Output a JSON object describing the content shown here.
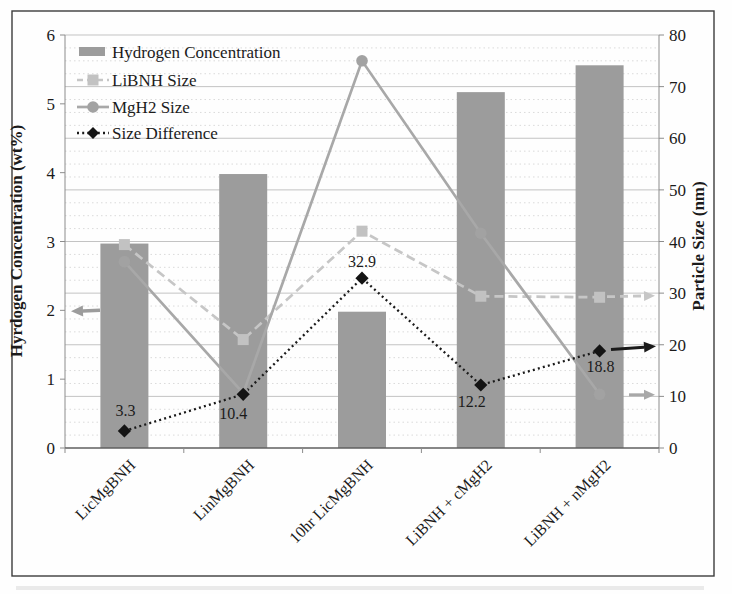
{
  "chart_data": {
    "type": "bar+line combo",
    "categories": [
      "LicMgBNH",
      "LinMgBNH",
      "10hr LicMgBNH",
      "LiBNH + cMgH2",
      "LiBNH + nMgH2"
    ],
    "series": [
      {
        "name": "Hydrogen Concentration",
        "type": "bar",
        "axis": "left",
        "values": [
          2.97,
          3.98,
          1.98,
          5.17,
          5.56
        ],
        "color": "#9c9c9c"
      },
      {
        "name": "LiBNH Size",
        "type": "line",
        "line_style": "dashed",
        "marker": "square",
        "axis": "right",
        "values": [
          39.4,
          21.0,
          42.0,
          29.4,
          29.2
        ],
        "color": "#c6c6c6",
        "marker_color": "#c2c2c2"
      },
      {
        "name": "MgH2 Size",
        "type": "line",
        "line_style": "solid",
        "marker": "circle",
        "axis": "right",
        "values": [
          36.1,
          10.6,
          75.0,
          41.6,
          10.4
        ],
        "color": "#a8a8a8",
        "marker_color": "#a2a2a2"
      },
      {
        "name": "Size Difference",
        "type": "line",
        "line_style": "dotted",
        "marker": "diamond",
        "axis": "right",
        "values": [
          3.3,
          10.4,
          32.9,
          12.2,
          18.8
        ],
        "color": "#1a1a1a",
        "marker_color": "#141414",
        "data_labels": [
          "3.3",
          "10.4",
          "32.9",
          "12.2",
          "18.8"
        ]
      }
    ],
    "left_axis": {
      "title": "Hyrdogen Concentration (wt%)",
      "min": 0,
      "max": 6,
      "step": 1,
      "tick_labels": [
        "0",
        "1",
        "2",
        "3",
        "4",
        "5",
        "6"
      ]
    },
    "right_axis": {
      "title": "Particle Size (nm)",
      "min": 0,
      "max": 80,
      "step": 10,
      "minor_step": 2.5,
      "tick_labels": [
        "0",
        "10",
        "20",
        "30",
        "40",
        "50",
        "60",
        "70",
        "80"
      ]
    },
    "legend": {
      "position": "top-left",
      "entries": [
        "Hydrogen Concentration",
        "LiBNH Size",
        "MgH2 Size",
        "Size Difference"
      ]
    },
    "annotations": {
      "left_arrow": {
        "points_to_axis": "left",
        "at_value": 2.0,
        "series": "Hydrogen Concentration"
      },
      "right_arrows": [
        {
          "points_to_axis": "right",
          "at_value": 29.5,
          "series": "LiBNH Size"
        },
        {
          "points_to_axis": "right",
          "at_value": 19.7,
          "series": "Size Difference"
        },
        {
          "points_to_axis": "right",
          "at_value": 10.3,
          "series": "MgH2 Size"
        }
      ]
    },
    "grid": {
      "major_color": "#c3c3c3",
      "minor_color": "#dadada",
      "minor_style": "dotted"
    },
    "colors": {
      "axis_line": "#8c8c8c",
      "bottom_axis_line": "#5f5f5f",
      "text": "#1b1b1b",
      "border": "#3c3c3c"
    }
  }
}
